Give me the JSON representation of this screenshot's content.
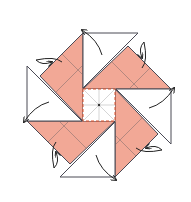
{
  "diagram": {
    "title": "",
    "colors": {
      "paper_colored": "#f2a896",
      "paper_white": "#ffffff",
      "outline": "#4a4a55",
      "crease": "#9a7a75",
      "center_dash": "#e0502a",
      "arrow": "#222222"
    },
    "center": [
      99,
      105
    ],
    "blades": 4,
    "arrows": 8
  }
}
